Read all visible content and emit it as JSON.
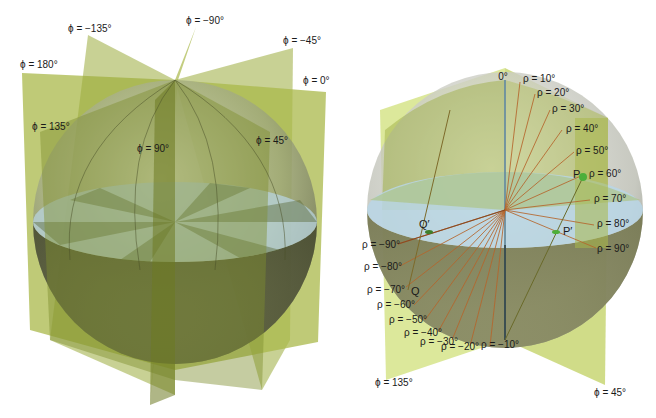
{
  "figure": {
    "left_panel": {
      "title": "Meridian planes (longitude) intersecting sphere",
      "phi_labels": [
        {
          "id": "phi-neg135",
          "text": "ϕ = −135°",
          "x": 68,
          "y": 32
        },
        {
          "id": "phi-neg90",
          "text": "ϕ = −90°",
          "x": 186,
          "y": 24
        },
        {
          "id": "phi-neg45",
          "text": "ϕ = −45°",
          "x": 283,
          "y": 44
        },
        {
          "id": "phi-180",
          "text": "ϕ = 180°",
          "x": 20,
          "y": 68
        },
        {
          "id": "phi-0",
          "text": "ϕ = 0°",
          "x": 303,
          "y": 84
        },
        {
          "id": "phi-135",
          "text": "ϕ = 135°",
          "x": 32,
          "y": 130
        },
        {
          "id": "phi-90",
          "text": "ϕ = 90°",
          "x": 137,
          "y": 152
        },
        {
          "id": "phi-45",
          "text": "ϕ = 45°",
          "x": 256,
          "y": 144
        }
      ]
    },
    "right_panel": {
      "title": "Latitude angles ρ on two meridian planes",
      "top_label": {
        "text": "0°",
        "x": 503,
        "y": 80
      },
      "rho_right": [
        {
          "text": "ρ = 10°",
          "x": 523,
          "y": 82
        },
        {
          "text": "ρ = 20°",
          "x": 537,
          "y": 96
        },
        {
          "text": "ρ = 30°",
          "x": 552,
          "y": 112
        },
        {
          "text": "ρ = 40°",
          "x": 566,
          "y": 132
        },
        {
          "text": "ρ = 50°",
          "x": 576,
          "y": 154
        },
        {
          "text": "ρ = 60°",
          "x": 589,
          "y": 177
        },
        {
          "text": "ρ = 70°",
          "x": 594,
          "y": 202
        },
        {
          "text": "ρ = 80°",
          "x": 597,
          "y": 227
        },
        {
          "text": "ρ = 90°",
          "x": 597,
          "y": 252
        }
      ],
      "rho_left": [
        {
          "text": "ρ = −90°",
          "x": 362,
          "y": 248
        },
        {
          "text": "ρ = −80°",
          "x": 364,
          "y": 270
        },
        {
          "text": "ρ = −70°",
          "x": 367,
          "y": 293
        },
        {
          "text": "ρ = −60°",
          "x": 377,
          "y": 308
        },
        {
          "text": "ρ = −50°",
          "x": 389,
          "y": 323
        },
        {
          "text": "ρ = −40°",
          "x": 404,
          "y": 336
        },
        {
          "text": "ρ = −30°",
          "x": 420,
          "y": 345
        },
        {
          "text": "ρ = −20°",
          "x": 441,
          "y": 350
        },
        {
          "text": "ρ = −10°",
          "x": 481,
          "y": 348
        }
      ],
      "points": [
        {
          "id": "P",
          "text": "P",
          "x": 573,
          "y": 178
        },
        {
          "id": "P-prime",
          "text": "P′",
          "x": 563,
          "y": 233
        },
        {
          "id": "Q-prime",
          "text": "Q′",
          "x": 419,
          "y": 228
        },
        {
          "id": "Q",
          "text": "Q",
          "x": 411,
          "y": 295
        }
      ],
      "phi_labels": [
        {
          "id": "phi-135",
          "text": "ϕ = 135°",
          "x": 375,
          "y": 386
        },
        {
          "id": "phi-45",
          "text": "ϕ = 45°",
          "x": 594,
          "y": 396
        }
      ]
    },
    "colors": {
      "plane_fill": "#a9b84a",
      "plane_light": "#d6e48a",
      "sphere_shade": "#6b6f55",
      "equator_fill": "#b9d6e6",
      "rho_line": "#b5652c",
      "point_green": "#4caf3a",
      "axis_blue": "#6b8fa0"
    }
  }
}
